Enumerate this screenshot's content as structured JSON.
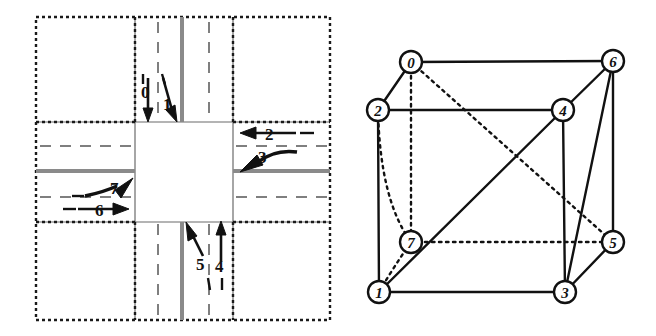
{
  "figure": {
    "caption": "",
    "panels": [
      {
        "id": "intersection-diagram",
        "name": "four-way-intersection-lane-map"
      },
      {
        "id": "cube-graph-diagram",
        "name": "conflict-graph-cube"
      }
    ]
  },
  "intersection": {
    "name": "intersection-lane-layout",
    "outer_boundary_style": "dotted",
    "centerline_color": "#808080",
    "lane_divider_style": "dashed",
    "road_edge_color": "#6b6b6b",
    "background": "#ffffff",
    "lane_labels": [
      {
        "id": "0",
        "text": "0",
        "approach": "north",
        "direction": "southbound-straight",
        "arrow": "down",
        "x": 148,
        "y": 95
      },
      {
        "id": "1",
        "text": "1",
        "approach": "north",
        "direction": "southbound-right",
        "arrow": "down-right",
        "x": 168,
        "y": 104
      },
      {
        "id": "2",
        "text": "2",
        "approach": "east",
        "direction": "westbound-straight",
        "arrow": "left",
        "x": 272,
        "y": 133
      },
      {
        "id": "3",
        "text": "3",
        "approach": "east",
        "direction": "westbound-left",
        "arrow": "down-left",
        "x": 264,
        "y": 158
      },
      {
        "id": "4",
        "text": "4",
        "approach": "south",
        "direction": "northbound-straight",
        "arrow": "up",
        "x": 221,
        "y": 262
      },
      {
        "id": "5",
        "text": "5",
        "approach": "south",
        "direction": "northbound-left",
        "arrow": "up-left",
        "x": 204,
        "y": 261
      },
      {
        "id": "6",
        "text": "6",
        "approach": "west",
        "direction": "eastbound-straight",
        "arrow": "right",
        "x": 101,
        "y": 208
      },
      {
        "id": "7",
        "text": "7",
        "approach": "west",
        "direction": "eastbound-left",
        "arrow": "up-right",
        "x": 113,
        "y": 190
      }
    ]
  },
  "cube_graph": {
    "name": "eight-node-conflict-graph",
    "node_radius": 10,
    "node_fill": "#ffffff",
    "node_stroke": "#111111",
    "edge_color": "#111111",
    "nodes": [
      {
        "id": "0",
        "label": "0",
        "x": 411,
        "y": 62
      },
      {
        "id": "1",
        "label": "1",
        "x": 379,
        "y": 292
      },
      {
        "id": "2",
        "label": "2",
        "x": 378,
        "y": 110
      },
      {
        "id": "3",
        "label": "3",
        "x": 565,
        "y": 292
      },
      {
        "id": "4",
        "label": "4",
        "x": 563,
        "y": 110
      },
      {
        "id": "5",
        "label": "5",
        "x": 613,
        "y": 242
      },
      {
        "id": "6",
        "label": "6",
        "x": 613,
        "y": 61
      },
      {
        "id": "7",
        "label": "7",
        "x": 411,
        "y": 242
      }
    ],
    "edges": [
      {
        "from": "0",
        "to": "6",
        "style": "solid"
      },
      {
        "from": "0",
        "to": "2",
        "style": "solid"
      },
      {
        "from": "0",
        "to": "7",
        "style": "dotted"
      },
      {
        "from": "0",
        "to": "5",
        "style": "dotted"
      },
      {
        "from": "2",
        "to": "4",
        "style": "solid"
      },
      {
        "from": "2",
        "to": "1",
        "style": "solid"
      },
      {
        "from": "2",
        "to": "7",
        "style": "dotted"
      },
      {
        "from": "4",
        "to": "6",
        "style": "solid"
      },
      {
        "from": "4",
        "to": "3",
        "style": "solid"
      },
      {
        "from": "4",
        "to": "1",
        "style": "solid"
      },
      {
        "from": "6",
        "to": "5",
        "style": "solid"
      },
      {
        "from": "6",
        "to": "3",
        "style": "solid"
      },
      {
        "from": "1",
        "to": "3",
        "style": "solid"
      },
      {
        "from": "1",
        "to": "7",
        "style": "dotted"
      },
      {
        "from": "3",
        "to": "5",
        "style": "solid"
      },
      {
        "from": "7",
        "to": "5",
        "style": "dotted"
      }
    ]
  }
}
